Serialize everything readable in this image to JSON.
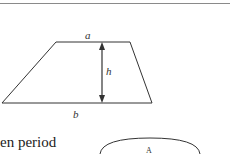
{
  "figure": {
    "shape": "trapezoid",
    "labels": {
      "top": "a",
      "height": "h",
      "bottom": "b"
    }
  },
  "body_text": "en period",
  "partial_figure": {
    "shape": "ellipse",
    "label": "A"
  }
}
